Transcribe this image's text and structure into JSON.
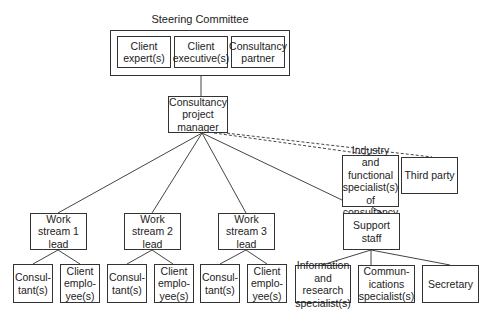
{
  "steering_committee": {
    "title": "Steering Committee",
    "members": [
      "Client expert(s)",
      "Client executive(s)",
      "Consultancy partner"
    ]
  },
  "project_manager": "Consultancy project manager",
  "work_streams": [
    {
      "lead": "Work stream 1 lead",
      "members": [
        "Consul-tant(s)",
        "Client emplo-yee(s)"
      ]
    },
    {
      "lead": "Work stream 2 lead",
      "members": [
        "Consul-tant(s)",
        "Client emplo-yee(s)"
      ]
    },
    {
      "lead": "Work stream 3 lead",
      "members": [
        "Consul-tant(s)",
        "Client emplo-yee(s)"
      ]
    }
  ],
  "specialists": "Industry and functional specialist(s) of consultancy",
  "third_party": "Third party",
  "support_staff": {
    "label": "Support staff",
    "members": [
      "Information and research specialist(s)",
      "Communications specialist(s)",
      "Secretary"
    ]
  },
  "display": {
    "sc_m0": [
      "Client",
      "expert(s)"
    ],
    "sc_m1": [
      "Client",
      "executive(s)"
    ],
    "sc_m2": [
      "Consultancy",
      "partner"
    ],
    "pm": [
      "Consultancy",
      "project",
      "manager"
    ],
    "ws1": [
      "Work",
      "stream 1",
      "lead"
    ],
    "ws2": [
      "Work",
      "stream 2",
      "lead"
    ],
    "ws3": [
      "Work",
      "stream 3",
      "lead"
    ],
    "consultant": [
      "Consul-",
      "tant(s)"
    ],
    "client_emp": [
      "Client",
      "emplo-",
      "yee(s)"
    ],
    "spec": [
      "Industry and",
      "functional",
      "specialist(s) of",
      "consultancy"
    ],
    "support": [
      "Support",
      "staff"
    ],
    "info": [
      "Information",
      "and research",
      "specialist(s)"
    ],
    "comm": [
      "Commun-",
      "ications",
      "specialist(s)"
    ]
  }
}
